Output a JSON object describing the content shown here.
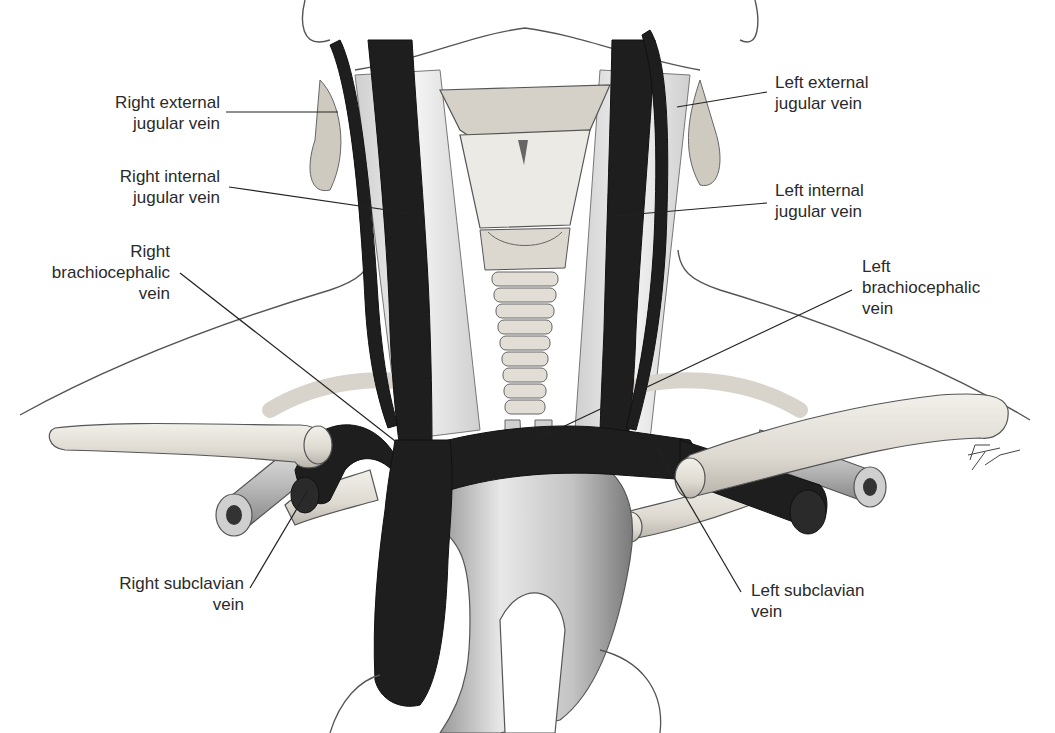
{
  "figure": {
    "signature": "Pat Thomas"
  },
  "labels": {
    "right_external_jugular": {
      "line1": "Right external",
      "line2": "jugular vein"
    },
    "right_internal_jugular": {
      "line1": "Right internal",
      "line2": "jugular vein"
    },
    "right_brachiocephalic": {
      "line1": "Right",
      "line2": "brachiocephalic",
      "line3": "vein"
    },
    "right_subclavian": {
      "line1": "Right subclavian",
      "line2": "vein"
    },
    "left_external_jugular": {
      "line1": "Left external",
      "line2": "jugular vein"
    },
    "left_internal_jugular": {
      "line1": "Left internal",
      "line2": "jugular vein"
    },
    "left_brachiocephalic": {
      "line1": "Left",
      "line2": "brachiocephalic",
      "line3": "vein"
    },
    "left_subclavian": {
      "line1": "Left subclavian",
      "line2": "vein"
    }
  },
  "colors": {
    "vein": "#1e1e1e",
    "bone": "#e6e3dc",
    "artery": "#bdbdbd",
    "outline": "#4a4a4a",
    "label_text": "#2a2a2a"
  }
}
